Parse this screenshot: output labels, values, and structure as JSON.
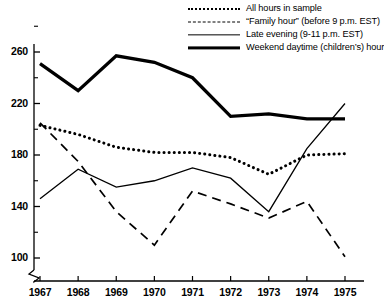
{
  "chart_data": {
    "type": "line",
    "title": "",
    "xlabel": "",
    "ylabel": "",
    "categories": [
      "1967",
      "1968",
      "1969",
      "1970",
      "1971",
      "1972",
      "1973",
      "1974",
      "1975"
    ],
    "x": [
      1967,
      1968,
      1969,
      1970,
      1971,
      1972,
      1973,
      1974,
      1975
    ],
    "ylim": [
      92,
      272
    ],
    "yticks": [
      100,
      140,
      180,
      220,
      260
    ],
    "ytick_labels": [
      "100",
      "140",
      "180",
      "220",
      "260"
    ],
    "yminor_ticks": [
      120,
      160,
      200,
      240
    ],
    "axis_break": true,
    "grid": false,
    "legend_position": "top-right",
    "series": [
      {
        "name": "All hours in sample",
        "style": "dotted",
        "values": [
          203,
          196,
          186,
          182,
          182,
          178,
          165,
          180,
          181
        ]
      },
      {
        "name": "“Family hour” (before 9 p.m. EST)",
        "style": "dashed",
        "values": [
          205,
          175,
          136,
          110,
          152,
          142,
          131,
          144,
          101
        ]
      },
      {
        "name": "Late evening (9-11 p.m. EST)",
        "style": "thin-solid",
        "values": [
          146,
          169,
          155,
          160,
          170,
          162,
          136,
          185,
          220
        ]
      },
      {
        "name": "Weekend daytime (children’s) hour",
        "style": "thick-solid",
        "values": [
          251,
          230,
          257,
          252,
          240,
          210,
          212,
          208,
          208
        ]
      }
    ]
  },
  "legend": {
    "items": [
      {
        "label": "All hours in sample",
        "icon": "dotted-line-swatch"
      },
      {
        "label": "“Family hour” (before 9 p.m. EST)",
        "icon": "dashed-line-swatch"
      },
      {
        "label": "Late evening (9-11 p.m. EST)",
        "icon": "thin-solid-line-swatch"
      },
      {
        "label": "Weekend daytime (children’s) hour",
        "icon": "thick-solid-line-swatch"
      }
    ]
  }
}
